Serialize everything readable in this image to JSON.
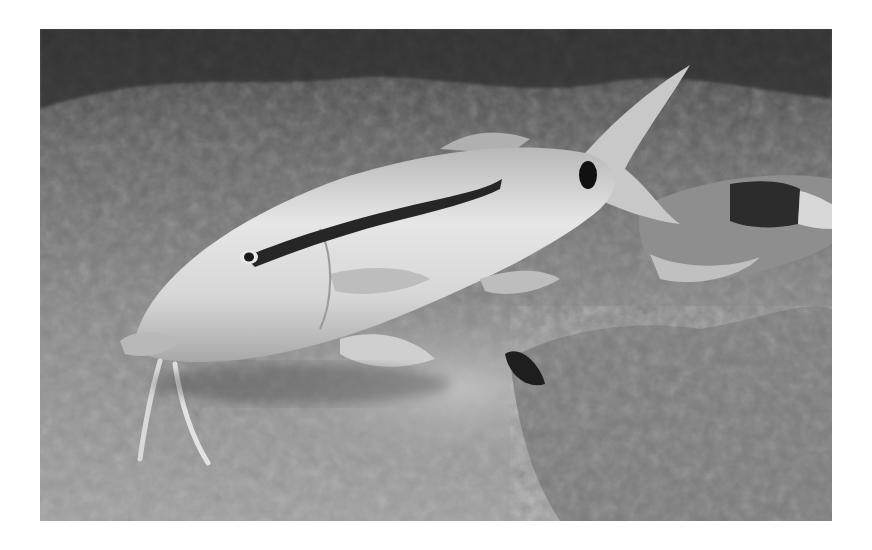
{
  "image": {
    "kind": "photograph",
    "colorMode": "grayscale",
    "subject": "goatfish foraging on sandy seafloor",
    "border": {
      "color": "#ffffff",
      "left": 40,
      "top": 29,
      "right": 832,
      "bottom": 521
    },
    "colors": {
      "background_dark": "#3a3a3a",
      "sand": "#8c8c8c",
      "sand_light": "#a8a8a8",
      "fish_body": "#d2d2d2",
      "fish_highlight": "#ececec",
      "stripe": "#2a2a2a",
      "rock": "#7a7a7a",
      "sediment_cloud": "#b4b4b4"
    },
    "elements": [
      {
        "name": "main-goatfish",
        "description": "Elongated pale fish with a dark lateral stripe running from the eye toward the tail, a black spot at the caudal peduncle, forked tail, and two barbels under the chin"
      },
      {
        "name": "second-goatfish",
        "description": "Partially visible second fish at right with a dark saddle patch"
      },
      {
        "name": "sediment-cloud",
        "description": "Pale cloud of stirred sand below the main fish"
      },
      {
        "name": "coral-rock",
        "description": "Textured rock outcrop at lower right"
      },
      {
        "name": "dark-reef-background",
        "description": "Dark rocky reef along the top edge"
      }
    ]
  }
}
